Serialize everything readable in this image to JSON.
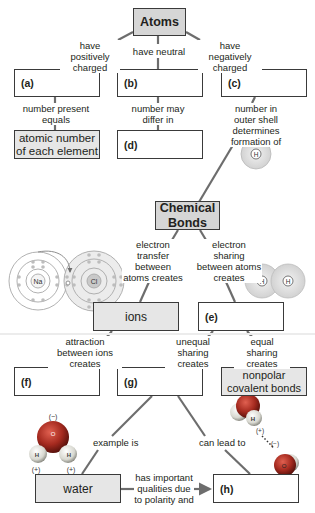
{
  "diagram": {
    "type": "concept_map",
    "colors": {
      "line": "#6d6d6d",
      "box_border": "#3a3a3a",
      "title_fill": "#d6d6d6",
      "answer_fill": "#e6e6e6",
      "blank_fill": "#ffffff",
      "oxygen": "#c0392b",
      "hydrogen": "#e8e8e8"
    },
    "nodes": {
      "atoms": "Atoms",
      "a": "(a)",
      "b": "(b)",
      "c": "(c)",
      "atomic_number": "atomic number of each element",
      "d": "(d)",
      "chemical_bonds": "Chemical Bonds",
      "ions": "ions",
      "e": "(e)",
      "f": "(f)",
      "g": "(g)",
      "nonpolar": "nonpolar covalent bonds",
      "water": "water",
      "h": "(h)"
    },
    "links": {
      "atoms_a": "have positively charged",
      "atoms_b": "have neutral",
      "atoms_c": "have negatively charged",
      "a_atomic": "number present equals",
      "b_d": "number may differ in",
      "c_bonds": "number in outer shell determines formation of",
      "bonds_ions": "electron transfer between atoms creates",
      "bonds_e": "electron sharing between atoms creates",
      "ions_f": "attraction between ions creates",
      "e_g": "unequal sharing creates",
      "e_nonpolar": "equal sharing creates",
      "g_water": "example is",
      "g_h": "can lead to",
      "water_h": "has important qualities due to polarity and"
    },
    "illustrations": {
      "hydrogen_atom": {
        "label": "H"
      },
      "ionic_transfer": {
        "left_atom": "Na",
        "right_atom": "Cl"
      },
      "h2_molecule": {
        "left_atom": "H",
        "right_atom": "H"
      },
      "water_molecule": {
        "oxygen": "O",
        "hydrogen_left": "H",
        "hydrogen_right": "H",
        "charge_top": "(−)",
        "charge_left": "(+)",
        "charge_right": "(+)"
      },
      "hydrogen_bond": {
        "hydrogen": "H",
        "oxygen": "O",
        "charge_h": "(+)",
        "charge_o": "(−)"
      }
    }
  }
}
